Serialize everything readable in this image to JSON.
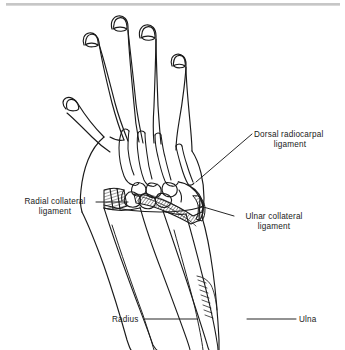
{
  "figure": {
    "kind": "anatomical-line-drawing",
    "view": "dorsal",
    "colors": {
      "ink": "#1a1a1a",
      "background": "#ffffff",
      "rule": "#8a8a8a",
      "hatch": "#2a2a2a"
    }
  },
  "rule": {
    "present": true
  },
  "labels": {
    "dorsal_radiocarpal": {
      "line1": "Dorsal radiocarpal",
      "line2": "ligament"
    },
    "radial_collateral": {
      "line1": "Radial collateral",
      "line2": "ligament"
    },
    "ulnar_collateral": {
      "line1": "Ulnar collateral",
      "line2": "ligament"
    },
    "radius": "Radius",
    "ulna": "Ulna"
  },
  "structures": [
    {
      "name": "index-finger"
    },
    {
      "name": "middle-finger"
    },
    {
      "name": "ring-finger"
    },
    {
      "name": "little-finger"
    },
    {
      "name": "thumb"
    },
    {
      "name": "metacarpal-bones"
    },
    {
      "name": "carpal-bones"
    },
    {
      "name": "dorsal-radiocarpal-ligament"
    },
    {
      "name": "radial-collateral-ligament"
    },
    {
      "name": "ulnar-collateral-ligament"
    },
    {
      "name": "radius-bone"
    },
    {
      "name": "ulna-bone"
    }
  ]
}
